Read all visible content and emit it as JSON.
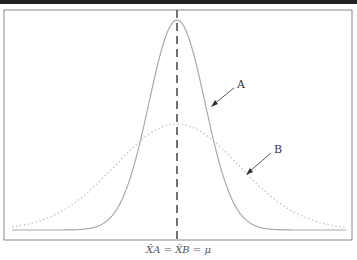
{
  "figure": {
    "labels": {
      "curve_a": "A",
      "curve_b": "B"
    },
    "xlabel": "X̄A = X̄B = μ"
  },
  "colors": {
    "curve_a": "#aaaaaa",
    "curve_b": "#c8c8c8",
    "frame": "#777777",
    "mean_line": "#444444"
  }
}
